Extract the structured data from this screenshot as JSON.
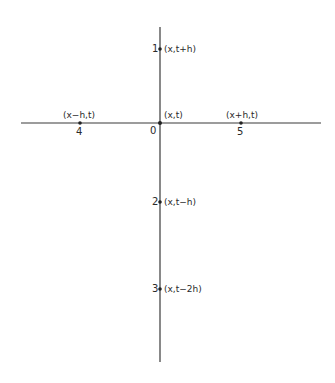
{
  "diagram": {
    "axes": {
      "horizontal": {
        "x1": 21,
        "y": 123,
        "x2": 321
      },
      "vertical": {
        "x": 160,
        "y1": 27,
        "y2": 362
      }
    },
    "points": [
      {
        "id": "0",
        "number": "0",
        "label": "(x,t)",
        "px": 160,
        "py": 123
      },
      {
        "id": "1",
        "number": "1",
        "label": "(x,t+h)",
        "px": 160,
        "py": 49
      },
      {
        "id": "2",
        "number": "2",
        "label": "(x,t−h)",
        "px": 160,
        "py": 202
      },
      {
        "id": "3",
        "number": "3",
        "label": "(x,t−2h)",
        "px": 160,
        "py": 289
      },
      {
        "id": "4",
        "number": "4",
        "label": "(x−h,t)",
        "px": 80,
        "py": 123
      },
      {
        "id": "5",
        "number": "5",
        "label": "(x+h,t)",
        "px": 241,
        "py": 123
      }
    ],
    "colors": {
      "line": "#3a3a3a",
      "text": "#2a2a2a",
      "background": "#ffffff"
    }
  }
}
